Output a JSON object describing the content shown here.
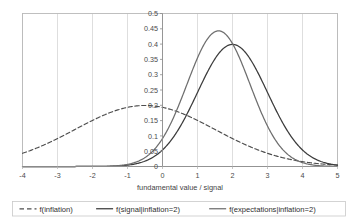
{
  "chart_data": {
    "type": "line",
    "title": "",
    "xlabel": "fundamental value / signal",
    "ylabel": "",
    "xlim": [
      -4,
      5
    ],
    "ylim": [
      0,
      0.5
    ],
    "grid": "vertical gridlines at each integer x",
    "legend_position": "bottom",
    "xticks": [
      "-4",
      "-3",
      "-2",
      "-1",
      "0",
      "1",
      "2",
      "3",
      "4",
      "5"
    ],
    "xtick_values": [
      -4,
      -3,
      -2,
      -1,
      0,
      1,
      2,
      3,
      4,
      5
    ],
    "yticks": [
      "0",
      "0.05",
      "0.1",
      "0.15",
      "0.2",
      "0.25",
      "0.3",
      "0.35",
      "0.4",
      "0.45",
      "0.5"
    ],
    "ytick_values": [
      0,
      0.05,
      0.1,
      0.15,
      0.2,
      0.25,
      0.3,
      0.35,
      0.4,
      0.45,
      0.5
    ],
    "series": [
      {
        "name": "f(inflation)",
        "style": "dashed",
        "color": "#4d4d4d",
        "distribution": "normal",
        "mean": -0.5,
        "sigma": 2.0,
        "peak_value": 0.2,
        "peak_x": -0.5,
        "x": [
          -4,
          -3.5,
          -3,
          -2.5,
          -2,
          -1.5,
          -1,
          -0.5,
          0,
          0.5,
          1,
          1.5,
          2,
          2.5,
          3,
          3.5,
          4,
          4.5,
          5
        ],
        "values": [
          0.0648,
          0.0863,
          0.1093,
          0.1315,
          0.1505,
          0.164,
          0.176,
          0.1995,
          0.176,
          0.164,
          0.1505,
          0.1315,
          0.1093,
          0.0863,
          0.0648,
          0.0457,
          0.0302,
          0.0188,
          0.011
        ]
      },
      {
        "name": "f(signal|inflation=2)",
        "style": "solid",
        "color": "#3c3c3c",
        "distribution": "normal",
        "mean": 2.0,
        "sigma": 1.0,
        "peak_value": 0.4,
        "peak_x": 2.0,
        "x": [
          -4,
          -3.5,
          -3,
          -2.5,
          -2,
          -1.5,
          -1,
          -0.5,
          0,
          0.5,
          1,
          1.5,
          2,
          2.5,
          3,
          3.5,
          4,
          4.5,
          5
        ],
        "values": [
          0.0,
          0.0,
          0.0,
          0.0,
          0.0001,
          0.0009,
          0.0044,
          0.0175,
          0.054,
          0.1295,
          0.242,
          0.3521,
          0.3989,
          0.3521,
          0.242,
          0.1295,
          0.054,
          0.0175,
          0.0044
        ]
      },
      {
        "name": "f(expectations|inflation=2)",
        "style": "solid",
        "color": "#6e6e6e",
        "distribution": "normal",
        "mean": 1.6,
        "sigma": 0.9,
        "peak_value": 0.445,
        "peak_x": 1.6,
        "x": [
          -4,
          -3.5,
          -3,
          -2.5,
          -2,
          -1.5,
          -1,
          -0.5,
          0,
          0.5,
          1,
          1.5,
          2,
          2.5,
          3,
          3.5,
          4,
          4.5,
          5
        ],
        "values": [
          0.0,
          0.0,
          0.0,
          0.0,
          0.0,
          0.0005,
          0.0032,
          0.0151,
          0.0544,
          0.1497,
          0.3154,
          0.4372,
          0.4272,
          0.3154,
          0.1766,
          0.0758,
          0.0249,
          0.0063,
          0.0012
        ]
      }
    ]
  },
  "legend": {
    "items": [
      {
        "label": "f(inflation)",
        "style": "dashed",
        "color": "#4d4d4d"
      },
      {
        "label": "f(signal|inflation=2)",
        "style": "solid",
        "color": "#3c3c3c"
      },
      {
        "label": "f(expectations|inflation=2)",
        "style": "solid",
        "color": "#6e6e6e"
      }
    ]
  }
}
